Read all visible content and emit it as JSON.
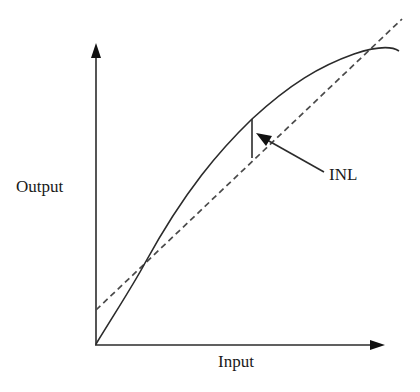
{
  "diagram": {
    "type": "ADC transfer function with integral non-linearity",
    "labels": {
      "y_axis": "Output",
      "x_axis": "Input",
      "annotation": "INL"
    },
    "elements": {
      "axes": {
        "origin": [
          96,
          344
        ],
        "y_arrow_tip": [
          96,
          44
        ],
        "x_arrow_tip": [
          384,
          345
        ]
      },
      "ideal_line": {
        "style": "dashed",
        "from": [
          96,
          310
        ],
        "to": [
          400,
          20
        ]
      },
      "actual_curve": {
        "style": "solid",
        "shape": "concave-down",
        "points": [
          [
            96,
            344
          ],
          [
            145,
            263
          ],
          [
            252,
            119
          ],
          [
            354,
            54
          ],
          [
            398,
            50
          ]
        ]
      },
      "inl_marker": {
        "style": "solid vertical bar",
        "x": 252,
        "y_top": 119,
        "y_bottom": 157
      },
      "inl_arrow": {
        "from": [
          324,
          172
        ],
        "to": [
          257,
          134
        ]
      }
    },
    "colors": {
      "stroke": "#2b2b2b",
      "dashed": "#4a4a4a",
      "text": "#1a1a1a",
      "background": "#ffffff"
    }
  }
}
